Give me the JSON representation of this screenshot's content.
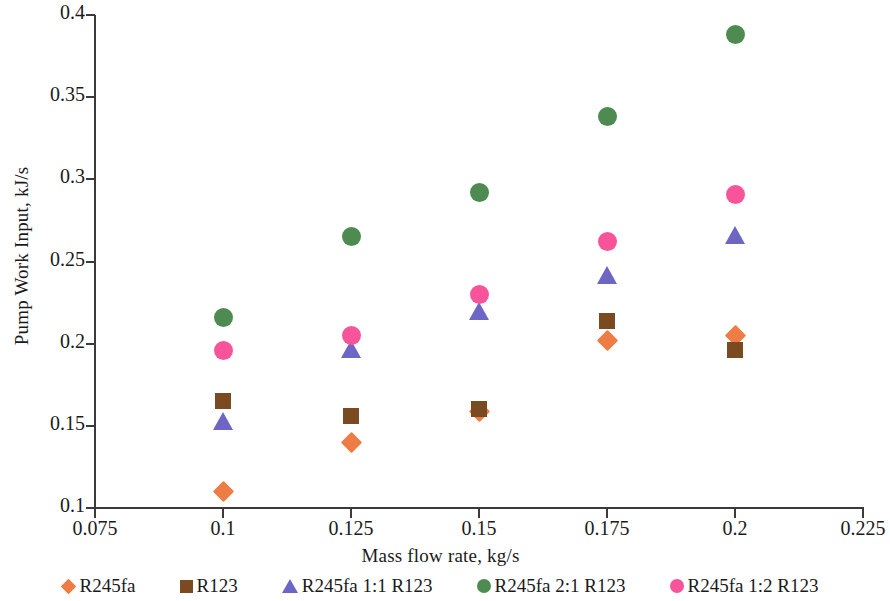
{
  "chart_data": {
    "type": "scatter",
    "title": "",
    "xlabel": "Mass flow rate, kg/s",
    "ylabel": "Pump Work Input, kJ/s",
    "xlim": [
      0.075,
      0.225
    ],
    "ylim": [
      0.1,
      0.4
    ],
    "xticks": [
      "0.075",
      "0.1",
      "0.125",
      "0.15",
      "0.175",
      "0.2",
      "0.225"
    ],
    "xtick_values": [
      0.075,
      0.1,
      0.125,
      0.15,
      0.175,
      0.2,
      0.225
    ],
    "yticks": [
      "0.1",
      "0.15",
      "0.2",
      "0.25",
      "0.3",
      "0.35",
      "0.4"
    ],
    "ytick_values": [
      0.1,
      0.15,
      0.2,
      0.25,
      0.3,
      0.35,
      0.4
    ],
    "grid": false,
    "legend_position": "bottom",
    "x": [
      0.1,
      0.125,
      0.15,
      0.175,
      0.2
    ],
    "series": [
      {
        "name": "R245fa",
        "marker": "diamond",
        "color": "#ED7D45",
        "values": [
          0.11,
          0.14,
          0.159,
          0.202,
          0.205
        ]
      },
      {
        "name": "R123",
        "marker": "square",
        "color": "#7A4A21",
        "values": [
          0.165,
          0.156,
          0.16,
          0.214,
          0.196
        ]
      },
      {
        "name": "R245fa 1:1 R123",
        "marker": "triangle",
        "color": "#6E66C4",
        "values": [
          0.153,
          0.197,
          0.22,
          0.242,
          0.266
        ]
      },
      {
        "name": "R245fa 2:1 R123",
        "marker": "circle",
        "color": "#4E8B50",
        "values": [
          0.216,
          0.265,
          0.292,
          0.338,
          0.388
        ]
      },
      {
        "name": "R245fa 1:2 R123",
        "marker": "circle",
        "color": "#F7549A",
        "values": [
          0.196,
          0.205,
          0.23,
          0.262,
          0.291
        ]
      }
    ]
  },
  "axis": {
    "color": "#3a3a3a"
  }
}
